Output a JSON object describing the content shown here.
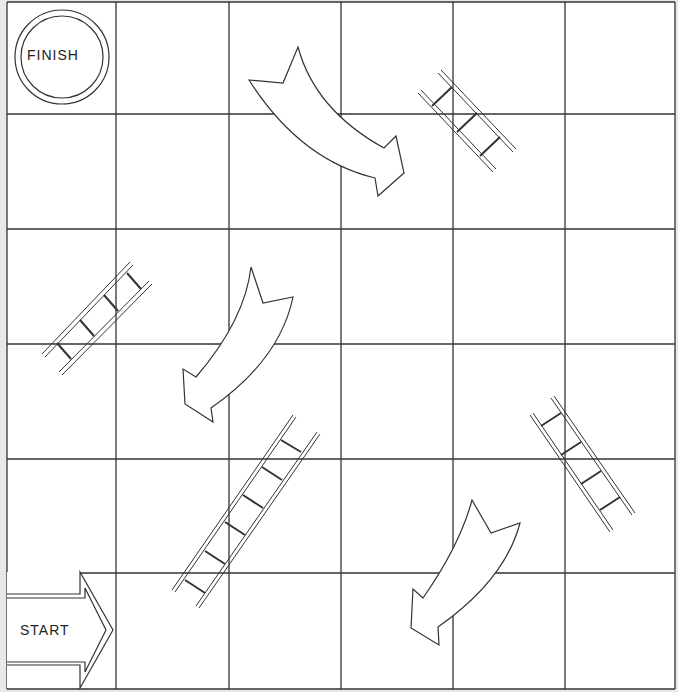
{
  "game": {
    "type": "snakes-and-ladders-style board (ladders and chute arrows)",
    "grid": {
      "rows": 6,
      "cols": 6,
      "x_lines": [
        7,
        116,
        229,
        341,
        453,
        565,
        675
      ],
      "y_lines": [
        2,
        114,
        229,
        344,
        459,
        573,
        689
      ]
    },
    "colors": {
      "background": "#e8e8e8",
      "board": "#ffffff",
      "line": "#333333"
    },
    "finish": {
      "label": "FINISH",
      "cell": [
        0,
        0
      ]
    },
    "start": {
      "label": "START",
      "cell": [
        5,
        0
      ]
    },
    "ladders": [
      {
        "id": "ladder-1",
        "from": [
          468,
          100
        ],
        "to": [
          510,
          160
        ],
        "rungs": 3
      },
      {
        "id": "ladder-2",
        "from": [
          48,
          350
        ],
        "to": [
          147,
          270
        ],
        "rungs": 4
      },
      {
        "id": "ladder-3",
        "from": [
          178,
          590
        ],
        "to": [
          315,
          420
        ],
        "rungs": 7
      },
      {
        "id": "ladder-4",
        "from": [
          540,
          410
        ],
        "to": [
          630,
          520
        ],
        "rungs": 4
      }
    ],
    "chutes": [
      {
        "id": "chute-1",
        "direction": "down-right",
        "from_cell": [
          0,
          2
        ],
        "to_cell": [
          1,
          3
        ]
      },
      {
        "id": "chute-2",
        "direction": "down-left",
        "from_cell": [
          2,
          2
        ],
        "to_cell": [
          3,
          1
        ]
      },
      {
        "id": "chute-3",
        "direction": "down-left",
        "from_cell": [
          4,
          4
        ],
        "to_cell": [
          5,
          3
        ]
      }
    ]
  }
}
